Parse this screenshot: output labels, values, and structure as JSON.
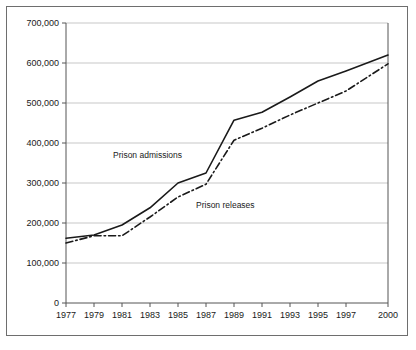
{
  "chart_data": {
    "type": "line",
    "title": "",
    "subtitle": "",
    "xlabel": "",
    "ylabel": "",
    "x": [
      1977,
      1979,
      1981,
      1983,
      1985,
      1987,
      1989,
      1991,
      1993,
      1995,
      1997,
      2000
    ],
    "x_tick_labels": [
      "1977",
      "1979",
      "1981",
      "1983",
      "1985",
      "1987",
      "1989",
      "1991",
      "1993",
      "1995",
      "1997",
      "2000"
    ],
    "y_tick_values": [
      0,
      100000,
      200000,
      300000,
      400000,
      500000,
      600000,
      700000
    ],
    "y_tick_labels": [
      "0",
      "100,000",
      "200,000",
      "300,000",
      "400,000",
      "500,000",
      "600,000",
      "700,000"
    ],
    "ylim": [
      0,
      700000
    ],
    "xlim": [
      1977,
      2000
    ],
    "grid": true,
    "grid_axis": "y",
    "legend": "inline-annotations",
    "series": [
      {
        "name": "Prison admissions",
        "style": "solid",
        "color": "#1a1a1a",
        "values": [
          162000,
          170000,
          195000,
          238000,
          300000,
          325000,
          457000,
          477000,
          515000,
          555000,
          580000,
          620000
        ]
      },
      {
        "name": "Prison releases",
        "style": "dash-dot",
        "color": "#1a1a1a",
        "values": [
          150000,
          168000,
          168000,
          215000,
          265000,
          297000,
          407000,
          437000,
          470000,
          500000,
          530000,
          598000
        ]
      }
    ],
    "annotations": [
      {
        "text": "Prison admissions",
        "x_px": 113,
        "y_px": 158
      },
      {
        "text": "Prison releases",
        "x_px": 196,
        "y_px": 208
      }
    ]
  },
  "colors": {
    "frame": "#6e6e6e",
    "gridline": "#b9b9b9",
    "axis": "#555555",
    "line": "#1a1a1a",
    "background": "#ffffff"
  }
}
